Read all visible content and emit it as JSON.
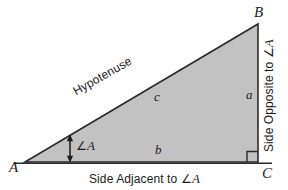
{
  "diagram": {
    "type": "right-triangle-trigonometry",
    "fill_color": "#c2c2c2",
    "stroke_color": "#2b2b2b",
    "background_color": "#ffffff",
    "vertices": [
      {
        "name": "A",
        "label": "A",
        "x": 25,
        "y": 162,
        "angle_marked": true
      },
      {
        "name": "B",
        "label": "B",
        "x": 258,
        "y": 24,
        "angle_marked": false
      },
      {
        "name": "C",
        "label": "C",
        "x": 258,
        "y": 162,
        "angle_marked": true,
        "right_angle": true
      }
    ],
    "sides": [
      {
        "name": "a",
        "label": "a",
        "between": "B-C",
        "description": "Side Opposite to ∠A"
      },
      {
        "name": "b",
        "label": "b",
        "between": "A-C",
        "description": "Side Adjacent to ∠A"
      },
      {
        "name": "c",
        "label": "c",
        "between": "A-B",
        "description": "Hypotenuse"
      }
    ],
    "labels": {
      "vertex_a": "A",
      "vertex_b": "B",
      "vertex_c": "C",
      "side_a": "a",
      "side_b": "b",
      "side_c": "c",
      "angle_a": "∠A",
      "angle_a_prefix": "∠",
      "angle_a_letter": "A",
      "hypotenuse": "Hypotenuse",
      "side_adjacent_prefix": "Side Adjacent to ∠",
      "side_adjacent_letter": "A",
      "side_opposite_prefix": "Side Opposite to ∠",
      "side_opposite_letter": "A"
    },
    "markers": {
      "right_angle_marker": "right-angle-square",
      "angle_a_marker": "double-headed-arrow"
    }
  }
}
